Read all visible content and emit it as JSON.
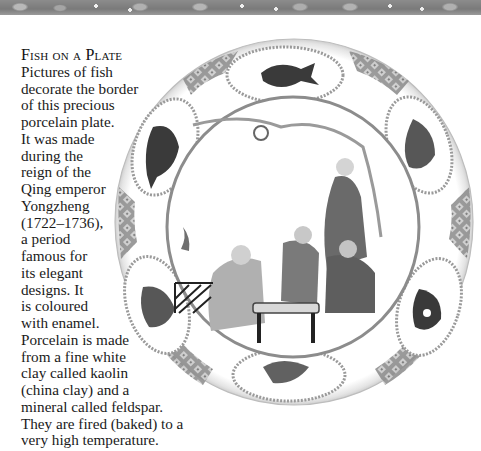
{
  "header": {
    "decorative_strip": "fish-pattern-border"
  },
  "article": {
    "title": "Fish on a Plate",
    "lines": [
      "Pictures of fish",
      "decorate the border",
      "of this precious",
      "porcelain plate.",
      "It was made",
      "during the",
      "reign of the",
      "Qing emperor",
      "Yongzheng",
      "(1722–1736),",
      "a period",
      "famous for",
      "its elegant",
      "designs. It",
      "is coloured",
      "with enamel.",
      "Porcelain is made",
      "from a fine white",
      "clay called kaolin",
      "(china clay) and a",
      "mineral called feldspar.",
      "They are fired (baked) to a",
      "very high temperature."
    ]
  },
  "image": {
    "subject": "porcelain-plate",
    "description": "Qing dynasty porcelain plate with fish cartouches on border and scene of figures at a table in center"
  }
}
